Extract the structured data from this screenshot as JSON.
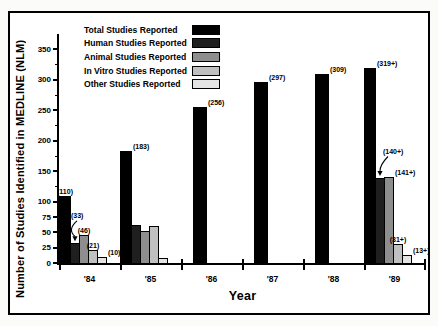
{
  "figure": {
    "ylabel": "Number of Studies Identified in MEDLINE (NLM)",
    "xlabel": "Year"
  },
  "legend": [
    {
      "label": "Total Studies Reported",
      "color": "#000000"
    },
    {
      "label": "Human Studies Reported",
      "color": "#1f1f1f"
    },
    {
      "label": "Animal Studies Reported",
      "color": "#8e8e8e"
    },
    {
      "label": "In Vitro Studies Reported",
      "color": "#c0c0c0"
    },
    {
      "label": "Other Studies Reported",
      "color": "#e4e4e4"
    }
  ],
  "chart_data": {
    "type": "bar",
    "title": "",
    "xlabel": "Year",
    "ylabel": "Number of Studies Identified in MEDLINE (NLM)",
    "categories": [
      "'84",
      "'85",
      "'86",
      "'87",
      "'88",
      "'89"
    ],
    "series": [
      {
        "name": "Total Studies Reported",
        "color": "#000000",
        "values": [
          110,
          183,
          256,
          297,
          309,
          319
        ],
        "labels": [
          "(110)",
          "(183)",
          "(256)",
          "(297)",
          "(309)",
          "(319+)"
        ]
      },
      {
        "name": "Human Studies Reported",
        "color": "#1f1f1f",
        "values": [
          33,
          62,
          null,
          null,
          null,
          140
        ],
        "labels": [
          "(33)",
          null,
          null,
          null,
          null,
          "(140+)"
        ]
      },
      {
        "name": "Animal Studies Reported",
        "color": "#8e8e8e",
        "values": [
          46,
          52,
          null,
          null,
          null,
          141
        ],
        "labels": [
          "(46)",
          null,
          null,
          null,
          null,
          "(141+)"
        ]
      },
      {
        "name": "In Vitro Studies Reported",
        "color": "#c0c0c0",
        "values": [
          21,
          60,
          null,
          null,
          null,
          31
        ],
        "labels": [
          "(21)",
          null,
          null,
          null,
          null,
          "(31+)"
        ]
      },
      {
        "name": "Other Studies Reported",
        "color": "#e4e4e4",
        "values": [
          10,
          9,
          null,
          null,
          null,
          13
        ],
        "labels": [
          "(10)",
          null,
          null,
          null,
          null,
          "(13+)"
        ]
      }
    ],
    "ylim": [
      0,
      375
    ],
    "yticks_labeled": [
      0,
      25,
      50,
      75,
      100,
      150,
      200,
      250,
      300,
      350
    ],
    "yticks_minor": [
      125,
      175,
      225,
      275,
      325
    ],
    "grid": false,
    "legend_position": "upper left inside"
  }
}
